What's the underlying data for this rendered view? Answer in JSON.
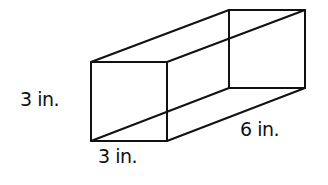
{
  "diagram": {
    "type": "rectangular-prism",
    "labels": {
      "height": "3 in.",
      "width": "3 in.",
      "length": "6 in."
    },
    "stroke_color": "#111111",
    "background": "#ffffff"
  }
}
